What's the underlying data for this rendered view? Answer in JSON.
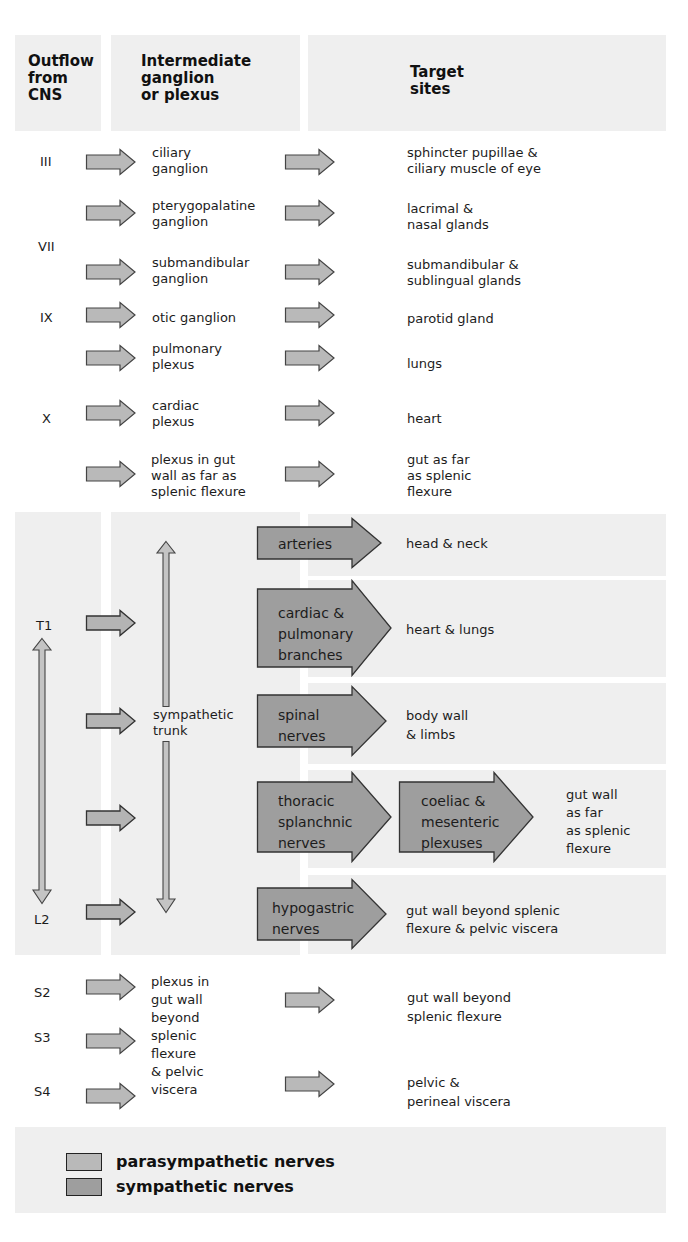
{
  "headers": {
    "outflow": "Outflow from CNS",
    "outflow_lines": [
      "Outflow",
      "from",
      "CNS"
    ],
    "intermediate_lines": [
      "Intermediate",
      "ganglion",
      "or plexus"
    ],
    "target_lines": [
      "Target",
      "sites"
    ]
  },
  "parasympathetic_cranial": [
    {
      "origin": "III",
      "ganglion": [
        "ciliary",
        "ganglion"
      ],
      "target": [
        "sphincter pupillae &",
        "ciliary muscle of eye"
      ]
    },
    {
      "origin": "",
      "ganglion": [
        "pterygopalatine",
        "ganglion"
      ],
      "target": [
        "lacrimal &",
        "nasal glands"
      ]
    },
    {
      "origin": "VII",
      "ganglion": [],
      "target": []
    },
    {
      "origin": "",
      "ganglion": [
        "submandibular",
        "ganglion"
      ],
      "target": [
        "submandibular &",
        "sublingual glands"
      ]
    },
    {
      "origin": "IX",
      "ganglion": [
        "otic ganglion"
      ],
      "target": [
        "parotid gland"
      ]
    },
    {
      "origin": "",
      "ganglion": [
        "pulmonary",
        "plexus"
      ],
      "target": [
        "lungs"
      ]
    },
    {
      "origin": "X",
      "ganglion": [
        "cardiac",
        "plexus"
      ],
      "target": [
        "heart"
      ]
    },
    {
      "origin": "",
      "ganglion": [
        "plexus in gut",
        "wall as far as",
        "splenic flexure"
      ],
      "target": [
        "gut as far",
        "as splenic",
        "flexure"
      ]
    }
  ],
  "sympathetic": {
    "origin_top": "T1",
    "origin_bottom": "L2",
    "trunk_label": [
      "sympathetic",
      "trunk"
    ],
    "branches": [
      {
        "nerve": [
          "arteries"
        ],
        "target": [
          "head & neck"
        ]
      },
      {
        "nerve": [
          "cardiac &",
          "pulmonary",
          "branches"
        ],
        "target": [
          "heart & lungs"
        ]
      },
      {
        "nerve": [
          "spinal",
          "nerves"
        ],
        "target": [
          "body wall",
          "& limbs"
        ]
      },
      {
        "nerve": [
          "thoracic",
          "splanchnic",
          "nerves"
        ],
        "relay": [
          "coeliac &",
          "mesenteric",
          "plexuses"
        ],
        "target": [
          "gut wall",
          "as far",
          "as splenic",
          "flexure"
        ]
      },
      {
        "nerve": [
          "hypogastric",
          "nerves"
        ],
        "target": [
          "gut wall beyond splenic",
          "flexure & pelvic viscera"
        ]
      }
    ]
  },
  "parasympathetic_sacral": {
    "origins": [
      "S2",
      "S3",
      "S4"
    ],
    "plexus": [
      "plexus in",
      "gut wall",
      "beyond",
      "splenic",
      "flexure",
      "& pelvic",
      "viscera"
    ],
    "targets": [
      [
        "gut wall beyond",
        "splenic flexure"
      ],
      [
        "pelvic &",
        "perineal viscera"
      ]
    ]
  },
  "legend": [
    {
      "label": "parasympathetic nerves",
      "color": "#b9b9b9"
    },
    {
      "label": "sympathetic nerves",
      "color": "#9e9e9e"
    }
  ],
  "colors": {
    "panel_bg": "#efefef",
    "parasympathetic_fill": "#b9b9b9",
    "sympathetic_fill": "#9e9e9e",
    "outline": "#333333"
  }
}
